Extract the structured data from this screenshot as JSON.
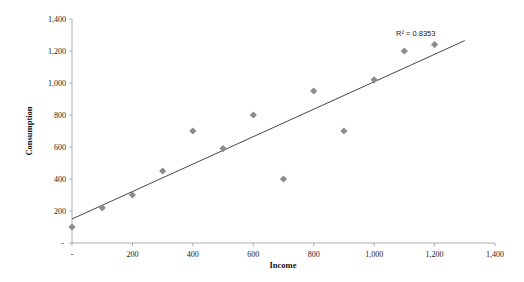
{
  "chart_data": {
    "type": "scatter",
    "title": "",
    "xlabel": "Income",
    "ylabel": "Consumption",
    "xlim": [
      0,
      1400
    ],
    "ylim": [
      0,
      1400
    ],
    "x_ticks": [
      "-",
      "200",
      "400",
      "600",
      "800",
      "1,000",
      "1,200",
      "1,400"
    ],
    "y_ticks": [
      "-",
      "200",
      "400",
      "600",
      "800",
      "1,000",
      "1,200",
      "1,400"
    ],
    "grid": false,
    "legend": null,
    "series": [
      {
        "name": "Consumption",
        "marker": "diamond",
        "color": "#8c8c8c",
        "points": [
          {
            "x": 0,
            "y": 100
          },
          {
            "x": 100,
            "y": 220
          },
          {
            "x": 200,
            "y": 300
          },
          {
            "x": 300,
            "y": 450
          },
          {
            "x": 400,
            "y": 700
          },
          {
            "x": 500,
            "y": 590
          },
          {
            "x": 600,
            "y": 800
          },
          {
            "x": 700,
            "y": 400
          },
          {
            "x": 800,
            "y": 950
          },
          {
            "x": 900,
            "y": 700
          },
          {
            "x": 1000,
            "y": 1020
          },
          {
            "x": 1100,
            "y": 1200
          },
          {
            "x": 1200,
            "y": 1240
          }
        ]
      }
    ],
    "trendline": {
      "type": "linear",
      "x_start": 0,
      "y_start": 150,
      "x_end": 1300,
      "y_end": 1265,
      "color": "#333333",
      "annotation": "R² = 0.8353"
    }
  }
}
